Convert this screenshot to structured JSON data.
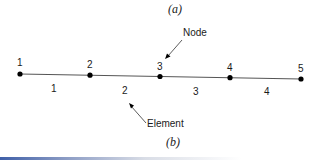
{
  "figure": {
    "caption_top": "(a)",
    "caption_bottom": "(b)",
    "annotations": {
      "node_label": "Node",
      "element_label": "Element"
    },
    "nodes": [
      {
        "label": "1",
        "x": 20,
        "y": 74
      },
      {
        "label": "2",
        "x": 90,
        "y": 75
      },
      {
        "label": "3",
        "x": 160,
        "y": 77
      },
      {
        "label": "4",
        "x": 230,
        "y": 78
      },
      {
        "label": "5",
        "x": 301,
        "y": 79
      }
    ],
    "elements": [
      {
        "label": "1",
        "x": 53,
        "y": 88
      },
      {
        "label": "2",
        "x": 125,
        "y": 89
      },
      {
        "label": "3",
        "x": 196,
        "y": 90
      },
      {
        "label": "4",
        "x": 266,
        "y": 91
      }
    ],
    "colors": {
      "line": "#555555",
      "node": "#000000",
      "accent_bar": "#3f5fa8"
    }
  }
}
